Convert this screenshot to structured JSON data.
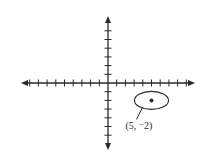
{
  "figure": {
    "type": "coordinate-plane",
    "background": "#ffffff",
    "stroke_color": "#2a2a2a",
    "origin_px": [
      108,
      83
    ],
    "unit_px": 8.7,
    "x_axis": {
      "ticks_negative": 9,
      "ticks_positive": 9,
      "arrows": true
    },
    "y_axis": {
      "ticks_positive": 6,
      "ticks_negative": 6,
      "arrows": true
    }
  },
  "point": {
    "x": 5,
    "y": -2,
    "label": "(5, ⁻2)",
    "highlight": "ellipse"
  }
}
